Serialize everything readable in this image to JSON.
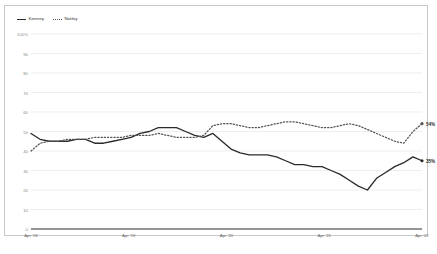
{
  "legend": {
    "items": [
      {
        "label": "Kenney",
        "style": "solid",
        "color": "#2b2b2b"
      },
      {
        "label": "Notley",
        "style": "dotted",
        "color": "#555555"
      }
    ]
  },
  "end_labels": {
    "notley": "54%",
    "kenney": "35%"
  },
  "chart_data": {
    "type": "line",
    "title": "",
    "xlabel": "",
    "ylabel": "",
    "ylim": [
      0,
      100
    ],
    "grid": true,
    "legend_position": "top-left",
    "y_ticks": [
      "100%",
      "90",
      "80",
      "70",
      "60",
      "50",
      "40",
      "30",
      "20",
      "10",
      "0"
    ],
    "y_tick_values": [
      100,
      90,
      80,
      70,
      60,
      50,
      40,
      30,
      20,
      10,
      0
    ],
    "x_ticks": [
      "Apr '18",
      "Apr '19",
      "Apr '20",
      "Apr '21",
      "Apr '22"
    ],
    "x_tick_values": [
      0,
      12,
      24,
      36,
      48
    ],
    "x_range": [
      0,
      48
    ],
    "series": [
      {
        "name": "Kenney",
        "style": "solid",
        "color": "#2b2b2b",
        "end_label": "35%",
        "values": [
          49,
          46,
          45,
          45,
          45,
          46,
          46,
          44,
          44,
          45,
          46,
          47,
          49,
          50,
          52,
          52,
          52,
          50,
          48,
          47,
          49,
          45,
          41,
          39,
          38,
          38,
          38,
          37,
          35,
          33,
          33,
          32,
          32,
          30,
          28,
          25,
          22,
          20,
          26,
          29,
          32,
          34,
          37,
          35
        ]
      },
      {
        "name": "Notley",
        "style": "dotted",
        "color": "#555555",
        "end_label": "54%",
        "values": [
          40,
          44,
          45,
          45,
          46,
          46,
          46,
          47,
          47,
          47,
          47,
          48,
          48,
          48,
          49,
          48,
          47,
          47,
          47,
          48,
          53,
          54,
          54,
          53,
          52,
          52,
          53,
          54,
          55,
          55,
          54,
          53,
          52,
          52,
          53,
          54,
          53,
          51,
          49,
          47,
          45,
          44,
          50,
          54
        ]
      }
    ]
  }
}
